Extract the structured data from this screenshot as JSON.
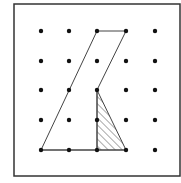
{
  "figure": {
    "grid": {
      "cols": 5,
      "rows": 5,
      "x": [
        41,
        69,
        97,
        126,
        155
      ],
      "y": [
        31,
        61,
        90,
        120,
        150
      ],
      "dot_color": "#111111",
      "dot_radius": 2.2
    },
    "frame": {
      "x": 14,
      "y": 4,
      "width": 166,
      "height": 172,
      "stroke": "#333333",
      "stroke_width": 1.5
    },
    "outline_polygon": {
      "description": "Polygon on dot grid",
      "points_grid": [
        [
          0,
          4
        ],
        [
          2,
          0
        ],
        [
          3,
          0
        ],
        [
          2,
          2
        ],
        [
          2,
          4
        ]
      ],
      "stroke": "#444444"
    },
    "shaded_triangle": {
      "description": "Hatched right triangle",
      "points_grid": [
        [
          2,
          2
        ],
        [
          2,
          4
        ],
        [
          3,
          4
        ]
      ],
      "pattern": "diagonal-hatch",
      "stroke": "#444444"
    },
    "bottom_segment": {
      "points_grid": [
        [
          0,
          4
        ],
        [
          3,
          4
        ]
      ]
    }
  }
}
